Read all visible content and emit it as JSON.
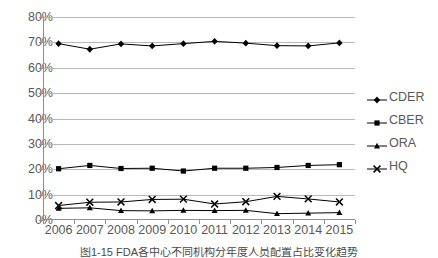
{
  "chart_data": {
    "type": "line",
    "title": "",
    "xlabel": "",
    "ylabel": "",
    "categories": [
      "2006",
      "2007",
      "2008",
      "2009",
      "2010",
      "2011",
      "2012",
      "2013",
      "2014",
      "2015"
    ],
    "ylim": [
      0,
      80
    ],
    "ytick_labels": [
      "0%",
      "10%",
      "20%",
      "30%",
      "40%",
      "50%",
      "60%",
      "70%",
      "80%"
    ],
    "ytick_values": [
      0,
      10,
      20,
      30,
      40,
      50,
      60,
      70,
      80
    ],
    "grid": true,
    "legend_position": "right",
    "series": [
      {
        "name": "CDER",
        "marker": "diamond",
        "color": "#000000",
        "values": [
          69.5,
          67.3,
          69.4,
          68.6,
          69.5,
          70.4,
          69.7,
          68.7,
          68.6,
          69.8
        ]
      },
      {
        "name": "CBER",
        "marker": "square",
        "color": "#000000",
        "values": [
          20.2,
          21.5,
          20.3,
          20.4,
          19.3,
          20.4,
          20.4,
          20.7,
          21.5,
          21.8
        ]
      },
      {
        "name": "ORA",
        "marker": "triangle",
        "color": "#000000",
        "values": [
          4.6,
          4.8,
          3.7,
          3.6,
          3.8,
          3.7,
          3.8,
          2.5,
          2.7,
          2.9
        ]
      },
      {
        "name": "HQ",
        "marker": "cross",
        "color": "#000000",
        "values": [
          5.7,
          7.0,
          7.1,
          8.1,
          8.2,
          6.3,
          7.2,
          9.3,
          8.3,
          7.1
        ]
      }
    ]
  },
  "caption": {
    "text": "图1-15  FDA各中心不同机构分年度人员配置占比变化趋势"
  },
  "colors": {
    "gridline": "#b8b8b8",
    "axis": "#8f8f8f",
    "text": "#595959",
    "series": "#000000"
  }
}
